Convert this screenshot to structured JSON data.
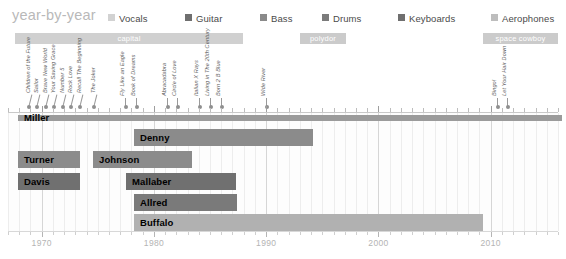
{
  "header": {
    "title": "year-by-year",
    "legend": [
      {
        "label": "Vocals",
        "color": "#d2d2d2",
        "x": 0
      },
      {
        "label": "Guitar",
        "color": "#6f6f6f",
        "x": 77
      },
      {
        "label": "Bass",
        "color": "#8a8a8a",
        "x": 152
      },
      {
        "label": "Drums",
        "color": "#7b7b7b",
        "x": 214
      },
      {
        "label": "Keyboards",
        "color": "#6f6f6f",
        "x": 290
      },
      {
        "label": "Aerophones",
        "color": "#bdbdbd",
        "x": 383
      }
    ]
  },
  "label_bars": [
    {
      "name": "capital",
      "x": 15,
      "width": 228,
      "color": "#d0d0d0"
    },
    {
      "name": "polydor",
      "x": 300,
      "width": 46,
      "color": "#cbcbcb"
    },
    {
      "name": "space cowboy",
      "x": 483,
      "width": 75,
      "color": "#cbcbcb"
    }
  ],
  "annotations": [
    {
      "title": "Children of the Future",
      "x": 28,
      "lean": true
    },
    {
      "title": "Sailor",
      "x": 36,
      "lean": true
    },
    {
      "title": "Brave New World",
      "x": 45,
      "lean": true
    },
    {
      "title": "Your Saving Grace",
      "x": 53,
      "lean": true
    },
    {
      "title": "Number 5",
      "x": 62,
      "lean": true
    },
    {
      "title": "Rock Love",
      "x": 70,
      "lean": true
    },
    {
      "title": "Recall The Beginning",
      "x": 79,
      "lean": true
    },
    {
      "title": "The Joker",
      "x": 93,
      "lean": true
    },
    {
      "title": "Fly Like an Eagle",
      "x": 125,
      "lean": false
    },
    {
      "title": "Book of Dreams",
      "x": 136,
      "lean": false
    },
    {
      "title": "Abracadabra",
      "x": 167,
      "lean": false
    },
    {
      "title": "Circle of Love",
      "x": 177,
      "lean": false
    },
    {
      "title": "Italian X Rays",
      "x": 199,
      "lean": false
    },
    {
      "title": "Living in The 20th Century",
      "x": 210,
      "lean": false
    },
    {
      "title": "Born 2 B Blue",
      "x": 221,
      "lean": false
    },
    {
      "title": "Wide River",
      "x": 266,
      "lean": false
    },
    {
      "title": "Bingo!",
      "x": 497,
      "lean": false
    },
    {
      "title": "Let Your Hair Down",
      "x": 507,
      "lean": false
    }
  ],
  "chart_data": {
    "type": "bar",
    "title": "year-by-year",
    "xlabel": "",
    "ylabel": "",
    "xlim": [
      1967,
      2014
    ],
    "tick_labels": [
      "1970",
      "1980",
      "1990",
      "2000",
      "2010"
    ],
    "tick_years": [
      1970,
      1980,
      1990,
      2000,
      2010
    ],
    "categories": [
      "Miller",
      "Denny",
      "Turner",
      "Johnson",
      "Davis",
      "Mallaber",
      "Allred",
      "Buffalo"
    ],
    "series": [
      {
        "name": "Miller",
        "role": "Vocals",
        "start": 1967,
        "end": 2014,
        "color": "#9b9b9b",
        "thin": true,
        "y": 2,
        "x": 10,
        "width": 544
      },
      {
        "name": "Denny",
        "role": "Guitar",
        "start": 1976,
        "end": 1993,
        "color": "#8b8b8b",
        "thin": false,
        "y": 16,
        "x": 126,
        "width": 179
      },
      {
        "name": "Turner",
        "role": "Bass",
        "start": 1967,
        "end": 1972,
        "color": "#8b8b8b",
        "thin": false,
        "y": 38,
        "x": 10,
        "width": 62
      },
      {
        "name": "Johnson",
        "role": "Keyboards",
        "start": 1975,
        "end": 1982,
        "color": "#8b8b8b",
        "thin": false,
        "y": 38,
        "x": 85,
        "width": 99
      },
      {
        "name": "Davis",
        "role": "Drums",
        "start": 1967,
        "end": 1972,
        "color": "#707070",
        "thin": false,
        "y": 60,
        "x": 10,
        "width": 62
      },
      {
        "name": "Mallaber",
        "role": "Drums",
        "start": 1977,
        "end": 1987,
        "color": "#707070",
        "thin": false,
        "y": 60,
        "x": 118,
        "width": 110
      },
      {
        "name": "Allred",
        "role": "Keyboards",
        "start": 1977,
        "end": 1986,
        "color": "#7a7a7a",
        "thin": false,
        "y": 81,
        "x": 126,
        "width": 103
      },
      {
        "name": "Buffalo",
        "role": "Aerophones",
        "start": 1977,
        "end": 2008,
        "color": "#b1b1b1",
        "thin": false,
        "y": 101,
        "x": 126,
        "width": 349
      }
    ]
  }
}
